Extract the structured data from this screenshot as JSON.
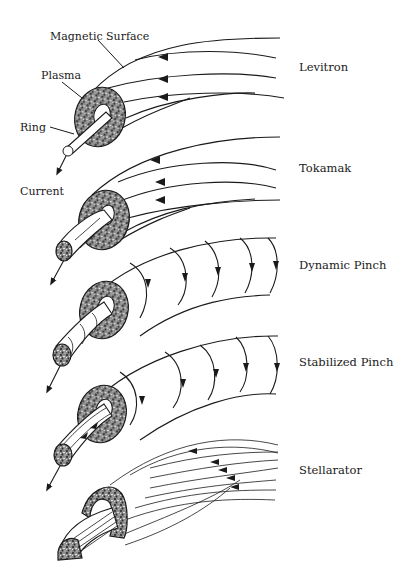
{
  "figure": {
    "labels": {
      "magnetic_surface": "Magnetic Surface",
      "plasma": "Plasma",
      "ring": "Ring",
      "current": "Current"
    },
    "configurations": [
      {
        "id": "levitron",
        "name": "Levitron"
      },
      {
        "id": "tokamak",
        "name": "Tokamak"
      },
      {
        "id": "dynamic-pinch",
        "name": "Dynamic Pinch"
      },
      {
        "id": "stabilized-pinch",
        "name": "Stabilized Pinch"
      },
      {
        "id": "stellarator",
        "name": "Stellarator"
      }
    ],
    "colors": {
      "ink": "#1a1a1a",
      "paper": "#ffffff"
    }
  }
}
